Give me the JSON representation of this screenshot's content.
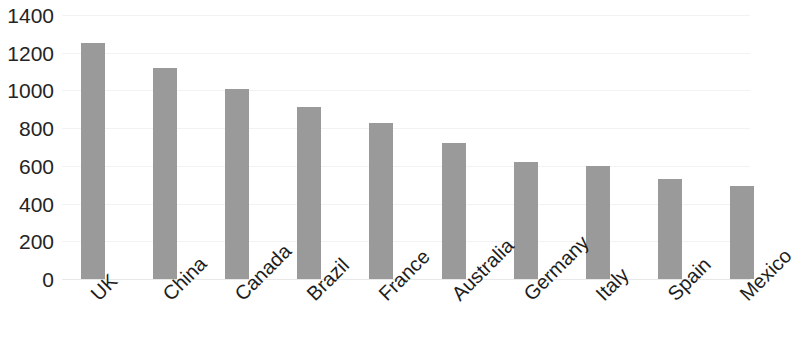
{
  "chart_data": {
    "type": "bar",
    "title": "",
    "subtitle": "",
    "xlabel": "",
    "ylabel": "",
    "categories": [
      "UK",
      "China",
      "Canada",
      "Brazil",
      "France",
      "Australia",
      "Germany",
      "Italy",
      "Spain",
      "Mexico"
    ],
    "values": [
      1250,
      1120,
      1010,
      910,
      825,
      720,
      620,
      600,
      530,
      495
    ],
    "ylim": [
      0,
      1400
    ],
    "y_ticks": [
      0,
      200,
      400,
      600,
      800,
      1000,
      1200,
      1400
    ],
    "y_tick_labels": [
      "0",
      "200",
      "400",
      "600",
      "800",
      "1000",
      "1200",
      "1400"
    ],
    "grid": true,
    "legend": null,
    "legend_position": "none",
    "bar_color": "#9a9a9a",
    "x_tick_rotation": -45
  },
  "axis": {
    "y_ticks": [
      {
        "label": "1400",
        "value": 1400
      },
      {
        "label": "1200",
        "value": 1200
      },
      {
        "label": "1000",
        "value": 1000
      },
      {
        "label": "800",
        "value": 800
      },
      {
        "label": "600",
        "value": 600
      },
      {
        "label": "400",
        "value": 400
      },
      {
        "label": "200",
        "value": 200
      },
      {
        "label": "0",
        "value": 0
      }
    ]
  },
  "bars": [
    {
      "label": "UK",
      "value": 1250
    },
    {
      "label": "China",
      "value": 1120
    },
    {
      "label": "Canada",
      "value": 1010
    },
    {
      "label": "Brazil",
      "value": 910
    },
    {
      "label": "France",
      "value": 825
    },
    {
      "label": "Australia",
      "value": 720
    },
    {
      "label": "Germany",
      "value": 620
    },
    {
      "label": "Italy",
      "value": 600
    },
    {
      "label": "Spain",
      "value": 530
    },
    {
      "label": "Mexico",
      "value": 495
    }
  ]
}
